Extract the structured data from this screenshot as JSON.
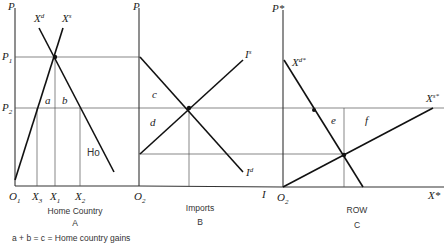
{
  "panels": [
    {
      "id": "home",
      "title": "Home Country",
      "letter": "A",
      "y_axis_label": "P",
      "x_axis_origin": "O",
      "x_axis_origin_sub": "1",
      "curves": [
        {
          "name": "demand",
          "label": "X",
          "label_sup": "d"
        },
        {
          "name": "supply",
          "label": "X",
          "label_sup": "s"
        }
      ],
      "price_labels": [
        {
          "label": "P",
          "sub": "1"
        },
        {
          "label": "P",
          "sub": "2"
        }
      ],
      "x_ticks": [
        {
          "label": "X",
          "sub": "3"
        },
        {
          "label": "X",
          "sub": "1"
        },
        {
          "label": "X",
          "sub": "2"
        }
      ],
      "regions": [
        "a",
        "b"
      ],
      "annotation": "Ho"
    },
    {
      "id": "imports",
      "title": "Imports",
      "letter": "B",
      "y_axis_label": "P",
      "x_axis_origin": "O",
      "x_axis_origin_sub": "2",
      "x_axis_end": "I",
      "curves": [
        {
          "name": "import-supply",
          "label": "I",
          "label_sup": "s"
        },
        {
          "name": "import-demand",
          "label": "I",
          "label_sup": "d"
        }
      ],
      "regions": [
        "c",
        "d"
      ]
    },
    {
      "id": "row",
      "title": "ROW",
      "letter": "C",
      "y_axis_label": "P*",
      "x_axis_origin": "O",
      "x_axis_origin_sub": "2",
      "x_axis_end": "X*",
      "curves": [
        {
          "name": "row-demand",
          "label": "X",
          "label_sup": "d*"
        },
        {
          "name": "row-supply",
          "label": "X",
          "label_sup": "s*"
        }
      ],
      "regions": [
        "e",
        "f"
      ]
    }
  ],
  "footnote": "a + b = c = Home country gains"
}
